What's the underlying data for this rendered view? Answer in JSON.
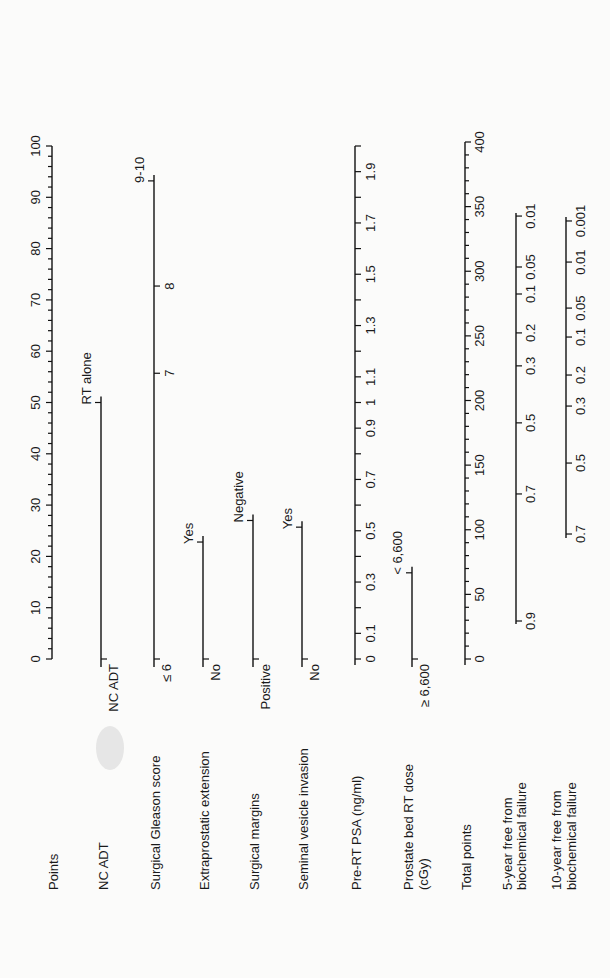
{
  "chart_data": {
    "type": "nomogram",
    "orientation": "rotated-90-ccw",
    "title": "",
    "points_scale": {
      "min": 0,
      "max": 100,
      "major_ticks": [
        0,
        10,
        20,
        30,
        40,
        50,
        60,
        70,
        80,
        90,
        100
      ],
      "minor_step": 2
    },
    "rows": [
      {
        "label": "Points",
        "kind": "points"
      },
      {
        "label": "NC ADT",
        "kind": "categorical",
        "levels": [
          {
            "label": "NC ADT",
            "points": 0
          },
          {
            "label": "RT alone",
            "points": 50
          }
        ]
      },
      {
        "label": "Surgical Gleason score",
        "kind": "categorical",
        "levels": [
          {
            "label": "≤ 6",
            "points": 0
          },
          {
            "label": "7",
            "points": 55.7
          },
          {
            "label": "8",
            "points": 72.7
          },
          {
            "label": "9-10",
            "points": 93.2
          }
        ]
      },
      {
        "label": "Extraprostatic extension",
        "kind": "categorical",
        "levels": [
          {
            "label": "No",
            "points": 0
          },
          {
            "label": "Yes",
            "points": 22.8
          }
        ]
      },
      {
        "label": "Surgical margins",
        "kind": "categorical",
        "levels": [
          {
            "label": "Positive",
            "points": 0
          },
          {
            "label": "Negative",
            "points": 27
          }
        ]
      },
      {
        "label": "Seminal vesicle invasion",
        "kind": "categorical",
        "levels": [
          {
            "label": "No",
            "points": 0
          },
          {
            "label": "Yes",
            "points": 25.7
          }
        ]
      },
      {
        "label": "Pre-RT PSA (ng/ml)",
        "kind": "continuous",
        "value_min": 0,
        "value_max": 2.0,
        "tick_labels": [
          "0",
          "0.1",
          "0.3",
          "0.5",
          "0.7",
          "0.9",
          "1",
          "1.1",
          "1.3",
          "1.5",
          "1.7",
          "1.9"
        ],
        "tick_values": [
          0,
          0.1,
          0.3,
          0.5,
          0.7,
          0.9,
          1.0,
          1.1,
          1.3,
          1.5,
          1.7,
          1.9
        ],
        "minor_values": [
          0.2,
          0.4,
          0.6,
          0.8,
          1.2,
          1.4,
          1.6,
          1.8,
          2.0
        ]
      },
      {
        "label": "Prostate bed RT dose (cGy)",
        "label_lines": [
          "Prostate bed RT dose",
          "(cGy)"
        ],
        "kind": "categorical",
        "levels": [
          {
            "label": "≥ 6,600",
            "points": 0
          },
          {
            "label": "< 6,600",
            "points": 16.8
          }
        ]
      },
      {
        "label": "Total points",
        "kind": "total",
        "min": 0,
        "max": 400,
        "major_ticks": [
          0,
          50,
          100,
          150,
          200,
          250,
          300,
          350,
          400
        ],
        "minor_step": 10
      },
      {
        "label": "5-year free from biochemical failure",
        "label_lines": [
          "5-year free from",
          "biochemical failure"
        ],
        "kind": "probability",
        "ticks": [
          {
            "label": "0.9",
            "total": 29.4
          },
          {
            "label": "0.7",
            "total": 127.7
          },
          {
            "label": "0.5",
            "total": 182.7
          },
          {
            "label": "0.3",
            "total": 226.8
          },
          {
            "label": "0.2",
            "total": 252.3
          },
          {
            "label": "0.1",
            "total": 282.4
          },
          {
            "label": "0.05",
            "total": 303.3
          },
          {
            "label": "0.01",
            "total": 342.7
          }
        ],
        "line_total_range": [
          27,
          345
        ]
      },
      {
        "label": "10-year free from biochemical failure",
        "label_lines": [
          "10-year free from",
          "biochemical failure"
        ],
        "kind": "probability",
        "ticks": [
          {
            "label": "0.7",
            "total": 96.7
          },
          {
            "label": "0.5",
            "total": 151.6
          },
          {
            "label": "0.3",
            "total": 195.7
          },
          {
            "label": "0.2",
            "total": 219.7
          },
          {
            "label": "0.1",
            "total": 249.1
          },
          {
            "label": "0.05",
            "total": 271.5
          },
          {
            "label": "0.01",
            "total": 307.1
          },
          {
            "label": "0.001",
            "total": 338.9
          }
        ],
        "line_total_range": [
          93.6,
          342
        ]
      }
    ],
    "xlabel": "",
    "ylabel": "",
    "grid": false,
    "legend": null
  },
  "layout": {
    "row_x": [
      52,
      101,
      154,
      203,
      253,
      302,
      355,
      412,
      465,
      516,
      566
    ],
    "label_x": [
      58,
      108,
      160,
      209,
      259,
      308,
      361,
      413,
      471,
      512,
      561
    ],
    "label_x2": [
      null,
      null,
      null,
      null,
      null,
      null,
      null,
      428,
      null,
      526,
      576
    ],
    "label_baseline_y": 890,
    "zero_y": 659,
    "top_y": 146,
    "total_top_y": 142
  }
}
